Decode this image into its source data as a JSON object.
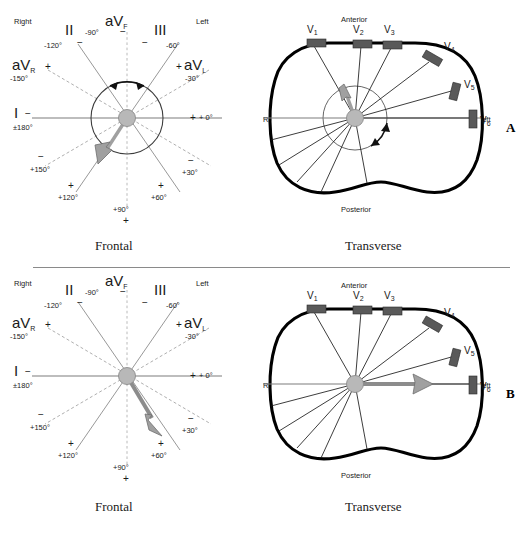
{
  "figure": {
    "type": "ecg-lead-vector-diagram",
    "panels": [
      "A",
      "B"
    ],
    "divider": true
  },
  "captions": {
    "frontal": "Frontal",
    "transverse": "Transverse"
  },
  "panel_a": {
    "id": "A",
    "frontal": {
      "orientation_left": "Right",
      "orientation_right": "Left",
      "leads": [
        {
          "name": "I",
          "sign_near": "−",
          "degrees": "±180°",
          "angle": 180
        },
        {
          "name": "aVR",
          "sign_near": "+",
          "degrees": "-150°",
          "angle": -150
        },
        {
          "name": "II",
          "sign_near": "−",
          "degrees": "-120°",
          "angle": -120
        },
        {
          "name": "aVF",
          "sign_near": "−",
          "degrees": "-90°",
          "angle": -90
        },
        {
          "name": "III",
          "sign_near": "−",
          "degrees": "-60°",
          "angle": -60
        },
        {
          "name": "aVL",
          "sign_near": "+",
          "degrees": "-30°",
          "angle": -30
        }
      ],
      "opposite_poles": [
        {
          "sign": "+",
          "degrees": "+ 0°",
          "angle": 0
        },
        {
          "sign": "−",
          "degrees": "+30°",
          "angle": 30
        },
        {
          "sign": "+",
          "degrees": "+60°",
          "angle": 60
        },
        {
          "sign": "+",
          "degrees": "+90°",
          "angle": 90
        },
        {
          "sign": "+",
          "degrees": "+120°",
          "angle": 120
        },
        {
          "sign": "−",
          "degrees": "+150°",
          "angle": 150
        }
      ],
      "vector_angle_deg": 110,
      "has_circle": true,
      "has_rotation_arrow": true
    },
    "transverse": {
      "anterior": "Anterior",
      "posterior": "Posterior",
      "orientation_left": "Right",
      "orientation_right": "Left",
      "precordial_leads": [
        "V1",
        "V2",
        "V3",
        "V4",
        "V5",
        "V6"
      ],
      "vector_direction": "anterior-superior",
      "has_rotation_arrow": true
    }
  },
  "panel_b": {
    "id": "B",
    "frontal": {
      "orientation_left": "Right",
      "orientation_right": "Left",
      "leads": [
        {
          "name": "I",
          "sign_near": "−",
          "degrees": "±180°",
          "angle": 180
        },
        {
          "name": "aVR",
          "sign_near": "+",
          "degrees": "-150°",
          "angle": -150
        },
        {
          "name": "II",
          "sign_near": "−",
          "degrees": "-120°",
          "angle": -120
        },
        {
          "name": "aVF",
          "sign_near": "−",
          "degrees": "-90°",
          "angle": -90
        },
        {
          "name": "III",
          "sign_near": "−",
          "degrees": "-60°",
          "angle": -60
        },
        {
          "name": "aVL",
          "sign_near": "+",
          "degrees": "-30°",
          "angle": -30
        }
      ],
      "opposite_poles": [
        {
          "sign": "+",
          "degrees": "+ 0°",
          "angle": 0
        },
        {
          "sign": "−",
          "degrees": "+30°",
          "angle": 30
        },
        {
          "sign": "+",
          "degrees": "+60°",
          "angle": 60
        },
        {
          "sign": "+",
          "degrees": "+90°",
          "angle": 90
        },
        {
          "sign": "+",
          "degrees": "+120°",
          "angle": 120
        },
        {
          "sign": "−",
          "degrees": "+150°",
          "angle": 150
        }
      ],
      "vector_angle_deg": 60,
      "has_circle": false,
      "has_rotation_arrow": false
    },
    "transverse": {
      "anterior": "Anterior",
      "posterior": "Posterior",
      "orientation_left": "Right",
      "orientation_right": "Left",
      "precordial_leads": [
        "V1",
        "V2",
        "V3",
        "V4",
        "V5",
        "V6"
      ],
      "vector_direction": "left-horizontal",
      "has_rotation_arrow": false
    }
  },
  "colors": {
    "vector_fill": "#a0a0a0",
    "hub_fill": "#b8b8b8",
    "electrode_pad": "#595959",
    "torso_outline": "#000000",
    "axis_line": "#7d7d7d"
  }
}
